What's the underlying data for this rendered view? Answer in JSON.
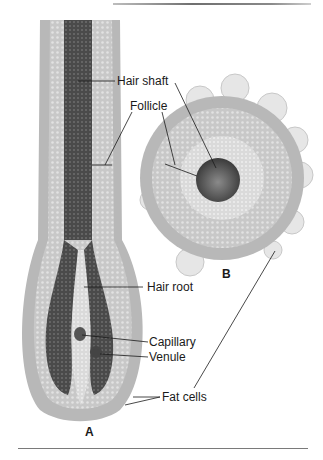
{
  "figure": {
    "panels": {
      "a": "A",
      "b": "B"
    },
    "labels": {
      "hair_shaft": "Hair shaft",
      "follicle": "Follicle",
      "hair_root": "Hair root",
      "capillary": "Capillary",
      "venule": "Venule",
      "fat_cells": "Fat cells"
    },
    "colors": {
      "outer_sheath": "#b4b4b4",
      "inner_sheath": "#cfcfcf",
      "hair_shaft": "#4a4a4a",
      "fat_cell": "#e6e6e6",
      "leader_line": "#1a1a1a"
    }
  }
}
